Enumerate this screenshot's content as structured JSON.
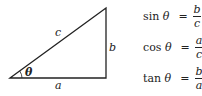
{
  "diagram": {
    "type": "right-triangle",
    "stroke_color": "#222222",
    "vertices": {
      "angle_vertex": [
        10,
        78
      ],
      "top_vertex": [
        106,
        8
      ],
      "right_angle_vertex": [
        106,
        78
      ]
    },
    "labels": {
      "hypotenuse": "c",
      "opposite": "b",
      "adjacent": "a",
      "angle": "θ"
    }
  },
  "formulas": [
    {
      "fn": "sin",
      "var": "θ",
      "equals": "=",
      "numerator": "b",
      "denominator": "c"
    },
    {
      "fn": "cos",
      "var": "θ",
      "equals": "=",
      "numerator": "a",
      "denominator": "c"
    },
    {
      "fn": "tan",
      "var": "θ",
      "equals": "=",
      "numerator": "b",
      "denominator": "a"
    }
  ]
}
